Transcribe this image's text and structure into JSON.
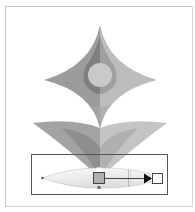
{
  "canvas": {
    "background": "#ffffff",
    "frame_border_color": "#c8c8c8"
  },
  "artwork": {
    "description": "Symmetric flower/star vector illustration with gradient annotator",
    "colors": {
      "star_left": "#9a9a9a",
      "star_right": "#b9b9b9",
      "drop_ring": "#7f7f7f",
      "drop_ring_right": "#9d9d9d",
      "circle": "#c8c8c8",
      "leaf_left_outer": "#a3a3a3",
      "leaf_left_inner": "#8c8c8c",
      "leaf_right_outer": "#c2c2c2",
      "leaf_right_inner": "#adadad"
    }
  },
  "selection": {
    "bounding_box_color": "#555555"
  },
  "gradient_annotator": {
    "ellipse_fill_start": "#ffffff",
    "ellipse_fill_end": "#d9d9d9",
    "origin_stop_color": "#b0b0b0",
    "end_stop_color": "#ffffff",
    "arrow_color": "#111111",
    "midpoint_marker_color": "#555555"
  }
}
